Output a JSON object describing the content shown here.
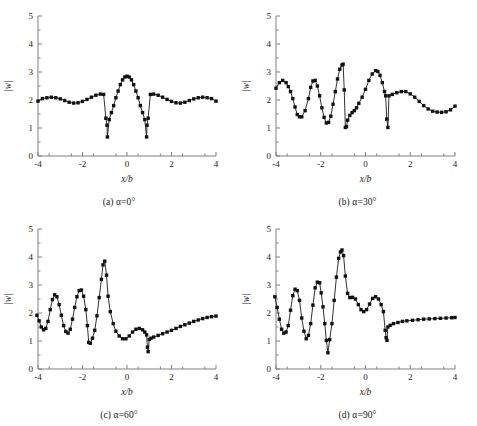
{
  "figure": {
    "background": "#ffffff",
    "line_color": "#1a1a1a",
    "marker_color": "#111111",
    "axis_color": "#808080"
  },
  "axes": {
    "xlabel": "x/b",
    "ylabel": "|w|",
    "xlim": [
      -4,
      4
    ],
    "ylim": [
      0,
      5
    ],
    "xticks": [
      -4,
      -2,
      0,
      2,
      4
    ],
    "yticks": [
      0,
      1,
      2,
      3,
      4,
      5
    ],
    "xtick_labels": [
      "-4",
      "-2",
      "0",
      "2",
      "4"
    ],
    "ytick_labels": [
      "0",
      "1",
      "2",
      "3",
      "4",
      "5"
    ],
    "grid": false,
    "legend": "none"
  },
  "captions": {
    "a": "(a) α=0°",
    "b": "(b) α=30°",
    "c": "(c) α=60°",
    "d": "(d) α=90°"
  },
  "chart_data": [
    {
      "type": "line",
      "id": "panel-a",
      "title": "(a) α=0°",
      "xlabel": "x/b",
      "ylabel": "|w|",
      "xlim": [
        -4,
        4
      ],
      "ylim": [
        0,
        5
      ],
      "grid": false,
      "marker": "square",
      "series": [
        {
          "name": "|w|",
          "x": [
            -4.0,
            -3.8,
            -3.6,
            -3.4,
            -3.2,
            -3.0,
            -2.8,
            -2.6,
            -2.4,
            -2.2,
            -2.0,
            -1.8,
            -1.6,
            -1.4,
            -1.2,
            -1.05,
            -0.95,
            -0.9,
            -0.88,
            -0.8,
            -0.7,
            -0.6,
            -0.5,
            -0.4,
            -0.3,
            -0.2,
            -0.1,
            0.0,
            0.1,
            0.2,
            0.3,
            0.4,
            0.5,
            0.6,
            0.7,
            0.8,
            0.88,
            0.9,
            0.95,
            1.05,
            1.2,
            1.4,
            1.6,
            1.8,
            2.0,
            2.2,
            2.4,
            2.6,
            2.8,
            3.0,
            3.2,
            3.4,
            3.6,
            3.8,
            4.0
          ],
          "y": [
            1.96,
            2.05,
            2.08,
            2.1,
            2.08,
            2.04,
            1.98,
            1.92,
            1.89,
            1.9,
            1.95,
            2.02,
            2.1,
            2.17,
            2.21,
            2.2,
            1.35,
            1.1,
            0.68,
            1.3,
            1.55,
            1.8,
            2.08,
            2.32,
            2.55,
            2.72,
            2.82,
            2.85,
            2.82,
            2.72,
            2.55,
            2.32,
            2.08,
            1.8,
            1.55,
            1.3,
            0.68,
            1.1,
            1.35,
            2.2,
            2.21,
            2.17,
            2.1,
            2.02,
            1.95,
            1.9,
            1.89,
            1.92,
            1.98,
            2.04,
            2.08,
            2.1,
            2.08,
            2.05,
            1.96
          ]
        }
      ]
    },
    {
      "type": "line",
      "id": "panel-b",
      "title": "(b) α=30°",
      "xlabel": "x/b",
      "ylabel": "|w|",
      "xlim": [
        -4,
        4
      ],
      "ylim": [
        0,
        5
      ],
      "grid": false,
      "marker": "square",
      "series": [
        {
          "name": "|w|",
          "x": [
            -4.0,
            -3.85,
            -3.7,
            -3.55,
            -3.45,
            -3.35,
            -3.25,
            -3.15,
            -3.05,
            -2.95,
            -2.85,
            -2.7,
            -2.55,
            -2.45,
            -2.35,
            -2.25,
            -2.15,
            -2.05,
            -1.95,
            -1.85,
            -1.75,
            -1.65,
            -1.55,
            -1.45,
            -1.35,
            -1.25,
            -1.15,
            -1.05,
            -1.0,
            -0.95,
            -0.9,
            -0.85,
            -0.8,
            -0.7,
            -0.6,
            -0.5,
            -0.4,
            -0.3,
            -0.15,
            0.0,
            0.15,
            0.3,
            0.45,
            0.55,
            0.65,
            0.75,
            0.85,
            0.9,
            0.95,
            1.0,
            1.05,
            1.2,
            1.4,
            1.6,
            1.8,
            2.0,
            2.2,
            2.4,
            2.6,
            2.8,
            3.0,
            3.2,
            3.4,
            3.6,
            3.8,
            4.0
          ],
          "y": [
            2.42,
            2.62,
            2.7,
            2.62,
            2.48,
            2.3,
            2.05,
            1.75,
            1.48,
            1.4,
            1.4,
            1.62,
            2.05,
            2.45,
            2.68,
            2.7,
            2.5,
            2.15,
            1.72,
            1.38,
            1.18,
            1.2,
            1.42,
            1.85,
            2.3,
            2.75,
            3.1,
            3.25,
            3.28,
            2.36,
            1.02,
            1.05,
            1.28,
            1.45,
            1.55,
            1.62,
            1.72,
            1.88,
            2.1,
            2.38,
            2.7,
            2.93,
            3.05,
            3.02,
            2.88,
            2.62,
            2.3,
            2.15,
            1.32,
            1.02,
            2.15,
            2.2,
            2.26,
            2.3,
            2.3,
            2.22,
            2.1,
            1.95,
            1.8,
            1.68,
            1.6,
            1.57,
            1.56,
            1.58,
            1.65,
            1.78
          ]
        }
      ]
    },
    {
      "type": "line",
      "id": "panel-c",
      "title": "(c) α=60°",
      "xlabel": "x/b",
      "ylabel": "|w|",
      "xlim": [
        -4,
        4
      ],
      "ylim": [
        0,
        5
      ],
      "grid": false,
      "marker": "square",
      "series": [
        {
          "name": "|w|",
          "x": [
            -4.05,
            -3.95,
            -3.85,
            -3.75,
            -3.65,
            -3.55,
            -3.45,
            -3.35,
            -3.25,
            -3.15,
            -3.05,
            -2.95,
            -2.85,
            -2.75,
            -2.65,
            -2.55,
            -2.45,
            -2.35,
            -2.25,
            -2.15,
            -2.05,
            -1.95,
            -1.85,
            -1.78,
            -1.72,
            -1.65,
            -1.55,
            -1.45,
            -1.35,
            -1.25,
            -1.15,
            -1.08,
            -1.0,
            -0.92,
            -0.85,
            -0.75,
            -0.62,
            -0.5,
            -0.35,
            -0.2,
            -0.05,
            0.1,
            0.25,
            0.4,
            0.55,
            0.7,
            0.8,
            0.88,
            0.92,
            0.95,
            1.0,
            1.08,
            1.2,
            1.4,
            1.6,
            1.8,
            2.0,
            2.2,
            2.4,
            2.6,
            2.8,
            3.0,
            3.2,
            3.4,
            3.6,
            3.8,
            4.0
          ],
          "y": [
            1.92,
            1.72,
            1.5,
            1.4,
            1.45,
            1.7,
            2.12,
            2.48,
            2.65,
            2.58,
            2.3,
            1.92,
            1.55,
            1.34,
            1.28,
            1.42,
            1.78,
            2.2,
            2.58,
            2.8,
            2.82,
            2.6,
            2.12,
            1.55,
            0.95,
            0.92,
            1.1,
            1.38,
            1.9,
            2.55,
            3.2,
            3.72,
            3.85,
            3.35,
            2.6,
            2.05,
            1.62,
            1.35,
            1.18,
            1.08,
            1.08,
            1.18,
            1.32,
            1.42,
            1.45,
            1.4,
            1.32,
            1.22,
            0.78,
            0.62,
            1.06,
            1.1,
            1.14,
            1.2,
            1.26,
            1.32,
            1.38,
            1.45,
            1.52,
            1.58,
            1.64,
            1.7,
            1.75,
            1.8,
            1.84,
            1.87,
            1.89
          ]
        }
      ]
    },
    {
      "type": "line",
      "id": "panel-d",
      "title": "(d) α=90°",
      "xlabel": "x/b",
      "ylabel": "|w|",
      "xlim": [
        -4,
        4
      ],
      "ylim": [
        0,
        5
      ],
      "grid": false,
      "marker": "square",
      "series": [
        {
          "name": "|w|",
          "x": [
            -4.05,
            -3.95,
            -3.85,
            -3.75,
            -3.65,
            -3.55,
            -3.45,
            -3.35,
            -3.25,
            -3.15,
            -3.05,
            -2.95,
            -2.85,
            -2.75,
            -2.65,
            -2.55,
            -2.45,
            -2.35,
            -2.25,
            -2.15,
            -2.05,
            -1.98,
            -1.9,
            -1.82,
            -1.75,
            -1.68,
            -1.6,
            -1.5,
            -1.4,
            -1.3,
            -1.2,
            -1.12,
            -1.05,
            -0.98,
            -0.9,
            -0.8,
            -0.7,
            -0.58,
            -0.45,
            -0.32,
            -0.2,
            -0.08,
            0.05,
            0.18,
            0.32,
            0.45,
            0.58,
            0.7,
            0.8,
            0.88,
            0.92,
            0.96,
            1.0,
            1.1,
            1.25,
            1.45,
            1.65,
            1.85,
            2.1,
            2.35,
            2.6,
            2.85,
            3.1,
            3.35,
            3.6,
            3.85,
            4.0
          ],
          "y": [
            2.58,
            2.2,
            1.78,
            1.42,
            1.28,
            1.32,
            1.55,
            2.1,
            2.62,
            2.85,
            2.8,
            2.45,
            1.82,
            1.35,
            1.08,
            1.2,
            1.62,
            2.28,
            2.9,
            3.1,
            3.08,
            2.72,
            2.22,
            1.62,
            1.02,
            0.58,
            1.05,
            1.62,
            2.45,
            3.28,
            3.95,
            4.18,
            4.25,
            4.05,
            3.32,
            2.7,
            2.55,
            2.56,
            2.5,
            2.3,
            2.12,
            2.05,
            2.12,
            2.32,
            2.52,
            2.58,
            2.5,
            2.3,
            2.05,
            1.38,
            1.12,
            1.02,
            1.5,
            1.56,
            1.62,
            1.66,
            1.7,
            1.72,
            1.74,
            1.76,
            1.78,
            1.79,
            1.8,
            1.81,
            1.82,
            1.83,
            1.84
          ]
        }
      ]
    }
  ]
}
